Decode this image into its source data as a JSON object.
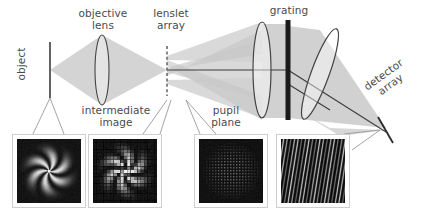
{
  "figure": {
    "type": "optical-ray-diagram",
    "background": "#ffffff",
    "ink_color": "#4a4a4a",
    "beam_color": "#c9c9c9",
    "grating_color": "#1a1a1a"
  },
  "labels": {
    "object": "object",
    "objective_lens": "objective\nlens",
    "lenslet_array": "lenslet\narray",
    "grating": "grating",
    "detector_array": "detector\narray",
    "intermediate_image": "intermediate\nimage",
    "pupil_plane": "pupil\nplane"
  },
  "components": [
    {
      "name": "object-plane",
      "kind": "vertical-bar",
      "x": 50,
      "y_top": 42,
      "y_bottom": 98
    },
    {
      "name": "objective-lens",
      "kind": "lens",
      "cx": 102,
      "cy": 70,
      "rx": 7,
      "ry": 35,
      "angle": 0
    },
    {
      "name": "lenslet-array",
      "kind": "dashed-bar",
      "x": 167,
      "y_top": 46,
      "y_bottom": 96
    },
    {
      "name": "collimator-lens",
      "kind": "lens",
      "cx": 262,
      "cy": 70,
      "rx": 9,
      "ry": 48,
      "angle": 0
    },
    {
      "name": "grating",
      "kind": "thick-bar",
      "x": 288,
      "y_top": 20,
      "y_bottom": 120
    },
    {
      "name": "camera-lens",
      "kind": "lens",
      "cx": 320,
      "cy": 73,
      "rx": 9,
      "ry": 48,
      "angle": 20
    },
    {
      "name": "detector-array",
      "kind": "tilted-bar",
      "x1": 378,
      "y1": 117,
      "x2": 393,
      "y2": 143
    }
  ],
  "panels": [
    {
      "name": "object-image",
      "pattern": "spiral-pinwheel",
      "arms": 6,
      "x": 12,
      "y": 134,
      "w": 74,
      "h": 74,
      "label_ref": "object"
    },
    {
      "name": "intermediate-image",
      "pattern": "spiral-sampled",
      "arms": 6,
      "x": 88,
      "y": 134,
      "w": 74,
      "h": 74,
      "label_ref": "intermediate_image"
    },
    {
      "name": "pupil-plane-image",
      "pattern": "spot-array",
      "x": 194,
      "y": 134,
      "w": 74,
      "h": 74,
      "label_ref": "pupil_plane"
    },
    {
      "name": "detector-image",
      "pattern": "spectral-stripes",
      "x": 276,
      "y": 134,
      "w": 74,
      "h": 74,
      "label_ref": "detector_array"
    }
  ],
  "leader_lines": [
    {
      "name": "leader-object",
      "from": [
        50,
        98
      ],
      "to": [
        33,
        134
      ]
    },
    {
      "name": "leader-intermediate-image",
      "from": [
        167,
        100
      ],
      "to": [
        143,
        134
      ]
    },
    {
      "name": "leader-lenslet-right",
      "from": [
        170,
        100
      ],
      "to": [
        160,
        134
      ]
    },
    {
      "name": "leader-pupil-plane",
      "from": [
        185,
        100
      ],
      "to": [
        216,
        134
      ]
    },
    {
      "name": "leader-detector",
      "from": [
        380,
        131
      ],
      "to": [
        344,
        134
      ]
    }
  ]
}
